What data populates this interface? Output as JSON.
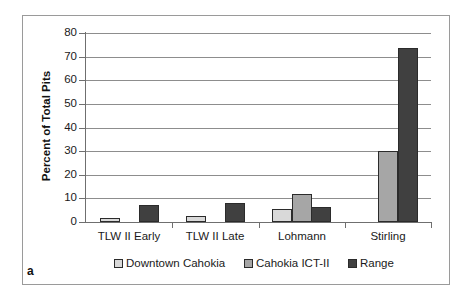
{
  "figure": {
    "panel_label": "a"
  },
  "chart_data": {
    "type": "bar",
    "title": "",
    "xlabel": "",
    "ylabel": "Percent of Total Pits",
    "ylim": [
      0,
      80
    ],
    "ytick_step": 10,
    "yticks": [
      80,
      70,
      60,
      50,
      40,
      30,
      20,
      10,
      0
    ],
    "grid": true,
    "legend_position": "bottom",
    "categories": [
      "TLW II Early",
      "TLW II Late",
      "Lohmann",
      "Stirling"
    ],
    "series": [
      {
        "name": "Downtown Cahokia",
        "color": "#d9d9d9",
        "values": [
          1.5,
          2.5,
          5.5,
          null
        ]
      },
      {
        "name": "Cahokia ICT-II",
        "color": "#a6a6a6",
        "values": [
          null,
          null,
          12.0,
          30.0
        ]
      },
      {
        "name": "Range",
        "color": "#404040",
        "values": [
          7.0,
          8.0,
          6.5,
          73.5
        ]
      }
    ]
  },
  "colors": {
    "downtown_cahokia": "#d9d9d9",
    "cahokia_ict_ii": "#a6a6a6",
    "range": "#404040",
    "gridline": "#8d8d8d",
    "axis": "#6f6f6f",
    "frame": "#9a9a9a",
    "bar_outline": "#2b2b2b"
  }
}
